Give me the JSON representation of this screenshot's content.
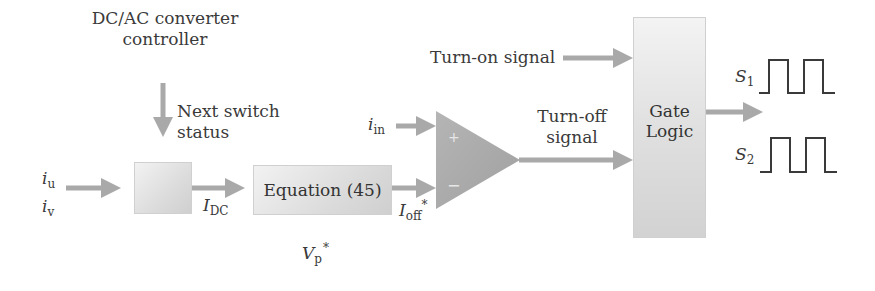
{
  "diagram": {
    "type": "block-diagram",
    "title": "",
    "colors": {
      "arrow": "#a9a9a9",
      "block_fill_light": "#f2f2f2",
      "block_fill_dark": "#cfcfcf",
      "comparator_fill": "#a8a8a8",
      "waveform_stroke": "#3a3a3a",
      "text": "#3a3a3a"
    },
    "controller": {
      "label_line1": "DC/AC converter",
      "label_line2": "controller",
      "arrow_label_line1": "Next switch",
      "arrow_label_line2": "status"
    },
    "inputs": {
      "iu_base": "i",
      "iu_sub": "u",
      "iv_base": "i",
      "iv_sub": "v"
    },
    "idc": {
      "base": "I",
      "sub": "DC"
    },
    "equation_block": {
      "label": "Equation (45)"
    },
    "vp": {
      "base": "V",
      "sub": "p",
      "sup": "*"
    },
    "ioff": {
      "base": "I",
      "sub": "off",
      "sup": "*"
    },
    "iin": {
      "base": "i",
      "sub": "in"
    },
    "comparator": {
      "plus": "+",
      "minus": "−"
    },
    "turn_on": {
      "label": "Turn-on signal"
    },
    "turn_off": {
      "label_line1": "Turn-off",
      "label_line2": "signal"
    },
    "gate_logic": {
      "label_line1": "Gate",
      "label_line2": "Logic"
    },
    "outputs": [
      {
        "base": "S",
        "sub": "1",
        "pulses": 2
      },
      {
        "base": "S",
        "sub": "2",
        "pulses": 2
      }
    ]
  }
}
